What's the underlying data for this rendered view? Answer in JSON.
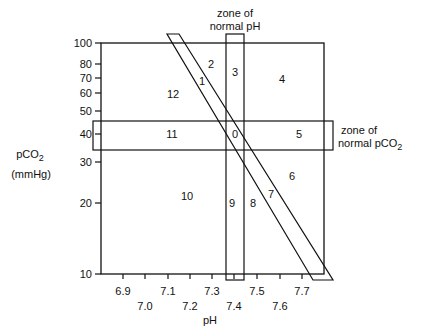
{
  "diagram": {
    "x_axis": {
      "label": "pH",
      "ticks_upper": [
        "6.9",
        "7.1",
        "7.3",
        "7.5",
        "7.7"
      ],
      "ticks_lower": [
        "7.0",
        "7.2",
        "7.4",
        "7.6"
      ]
    },
    "y_axis": {
      "label_line1": "pCO",
      "label_sub": "2",
      "label_line2": "(mmHg)",
      "ticks": [
        "100",
        "80",
        "70",
        "60",
        "50",
        "40",
        "30",
        "20",
        "10"
      ]
    },
    "annotations": {
      "ph_zone_line1": "zone of",
      "ph_zone_line2": "normal pH",
      "pco2_zone_line1": "zone of",
      "pco2_zone_line2": "normal pCO",
      "pco2_zone_sub": "2"
    },
    "regions": [
      "0",
      "1",
      "2",
      "3",
      "4",
      "5",
      "6",
      "7",
      "8",
      "9",
      "10",
      "11",
      "12"
    ],
    "colors": {
      "line": "#111111",
      "background": "#ffffff"
    }
  }
}
